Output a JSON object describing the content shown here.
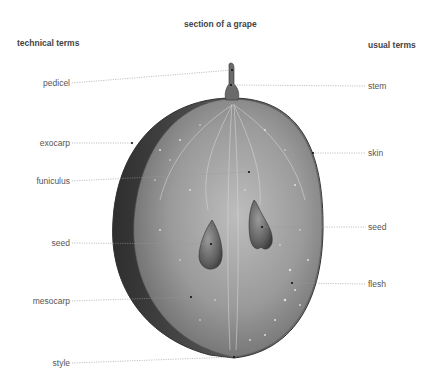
{
  "title": "section of a grape",
  "headers": {
    "left": "technical terms",
    "right": "usual terms"
  },
  "technical_terms": [
    {
      "label": "pedicel",
      "y": 83
    },
    {
      "label": "exocarp",
      "y": 143
    },
    {
      "label": "funiculus",
      "y": 181
    },
    {
      "label": "seed",
      "y": 243
    },
    {
      "label": "mesocarp",
      "y": 301
    },
    {
      "label": "style",
      "y": 363
    }
  ],
  "usual_terms": [
    {
      "label": "stem",
      "y": 86
    },
    {
      "label": "skin",
      "y": 153
    },
    {
      "label": "seed",
      "y": 227
    },
    {
      "label": "flesh",
      "y": 284
    }
  ],
  "colors": {
    "leader_line": "#999999",
    "grape_dark": "#3a3a3a",
    "grape_mid": "#8a8a8a",
    "grape_light": "#c8c8c8",
    "text": "#555555"
  }
}
